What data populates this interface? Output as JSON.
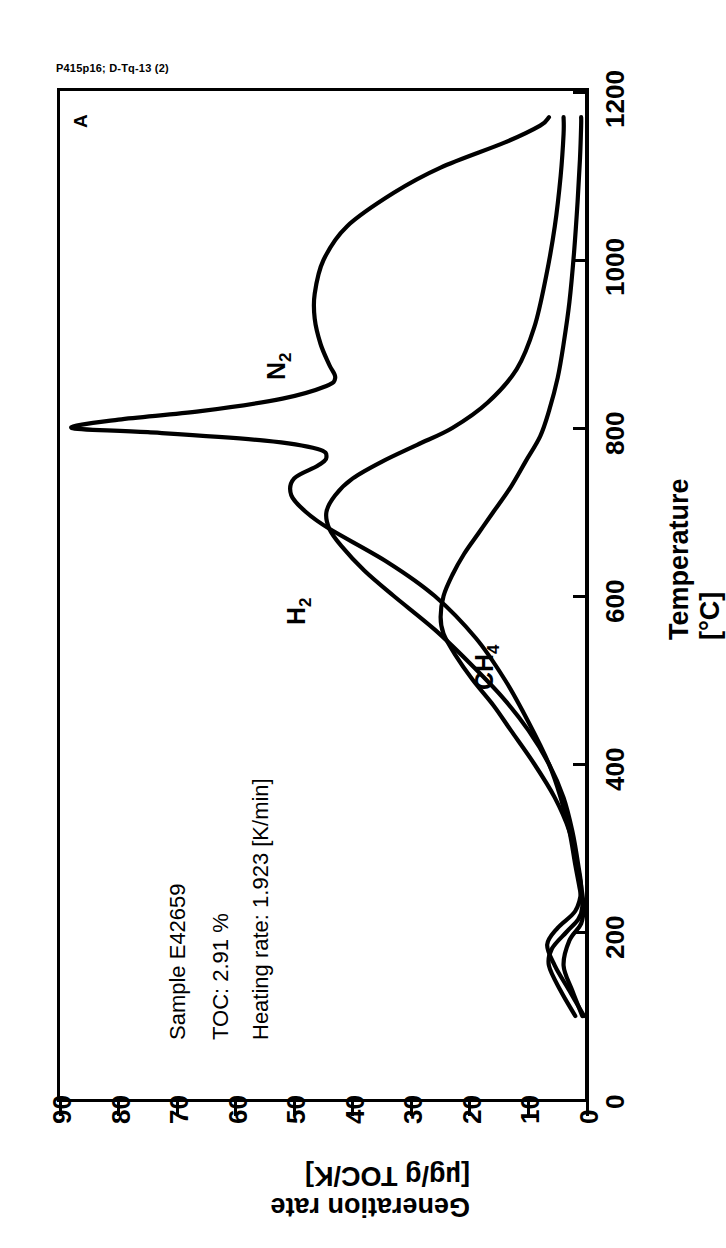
{
  "header": {
    "code": "P415p16; D-Tq-13 (2)",
    "panel_letter": "A"
  },
  "annotations": {
    "sample": "Sample    E42659",
    "toc": "TOC: 2.91 %",
    "heating_rate": "Heating rate: 1.923 [K/min]"
  },
  "axes": {
    "temperature_title": "Temperature [°C]",
    "rate_title": "Generation rate [µg/g TOC/K]",
    "temperature_ticks": [
      "0",
      "200",
      "400",
      "600",
      "800",
      "1000",
      "1200"
    ],
    "rate_ticks": [
      "0",
      "10",
      "20",
      "30",
      "40",
      "50",
      "60",
      "70",
      "80",
      "90"
    ]
  },
  "curve_labels": {
    "n2": "N",
    "n2_sub": "2",
    "h2": "H",
    "h2_sub": "2",
    "ch4": "CH",
    "ch4_sub": "4"
  },
  "colors": {
    "line": "#000000",
    "background": "#ffffff"
  },
  "chart_data": {
    "type": "line",
    "title": "P415p16; D-Tq-13 (2)",
    "orientation": "rotated-90",
    "xlabel": "Temperature [°C]",
    "ylabel": "Generation rate [µg/g TOC/K]",
    "xlim": [
      0,
      1200
    ],
    "ylim": [
      0,
      90
    ],
    "grid": false,
    "legend": "inline-curve-labels",
    "annotations": [
      "Sample    E42659",
      "TOC: 2.91 %",
      "Heating rate: 1.923 [K/min]",
      "A"
    ],
    "series": [
      {
        "name": "N2",
        "label": "N₂",
        "x": [
          100,
          130,
          160,
          180,
          200,
          215,
          230,
          250,
          280,
          320,
          360,
          400,
          450,
          500,
          550,
          600,
          640,
          680,
          700,
          720,
          740,
          755,
          765,
          775,
          785,
          795,
          800,
          810,
          820,
          835,
          850,
          860,
          875,
          900,
          930,
          960,
          1000,
          1040,
          1080,
          1110,
          1140,
          1160,
          1170
        ],
        "y": [
          2.0,
          4.5,
          6.5,
          6.0,
          3.5,
          1.5,
          0.8,
          1.2,
          2.0,
          3.0,
          4.5,
          6.5,
          10.0,
          14.0,
          19.0,
          26.0,
          34.0,
          44.0,
          48.0,
          50.5,
          50.0,
          46.0,
          44.5,
          46.0,
          55.0,
          75.0,
          88.0,
          80.0,
          66.0,
          52.0,
          44.5,
          43.0,
          44.0,
          45.5,
          46.5,
          46.5,
          45.0,
          41.0,
          33.0,
          25.0,
          14.0,
          8.0,
          6.5
        ]
      },
      {
        "name": "H2",
        "label": "H₂",
        "x": [
          100,
          130,
          160,
          185,
          205,
          225,
          250,
          280,
          320,
          360,
          400,
          440,
          480,
          520,
          560,
          600,
          630,
          660,
          680,
          700,
          720,
          740,
          760,
          780,
          800,
          830,
          870,
          920,
          980,
          1040,
          1100,
          1150,
          1170
        ],
        "y": [
          0.5,
          3.0,
          5.5,
          6.8,
          5.0,
          2.0,
          1.0,
          1.5,
          2.5,
          4.0,
          6.5,
          10.0,
          14.5,
          20.0,
          26.0,
          33.0,
          38.0,
          42.0,
          44.0,
          44.5,
          43.0,
          40.0,
          35.0,
          29.0,
          23.0,
          17.0,
          12.0,
          9.0,
          7.0,
          5.5,
          4.5,
          4.0,
          4.0
        ]
      },
      {
        "name": "CH4",
        "label": "CH₄",
        "x": [
          100,
          130,
          160,
          190,
          210,
          230,
          255,
          285,
          320,
          360,
          400,
          440,
          470,
          500,
          530,
          555,
          575,
          600,
          625,
          650,
          675,
          700,
          730,
          760,
          790,
          820,
          860,
          900,
          950,
          1010,
          1070,
          1120,
          1160,
          1170
        ],
        "y": [
          0.8,
          2.5,
          4.0,
          3.0,
          1.0,
          0.6,
          1.0,
          1.8,
          3.0,
          5.5,
          9.0,
          13.0,
          16.0,
          19.5,
          22.5,
          24.5,
          25.0,
          24.5,
          23.0,
          21.0,
          18.5,
          16.0,
          13.0,
          10.5,
          8.0,
          6.5,
          5.0,
          4.0,
          3.0,
          2.2,
          1.6,
          1.2,
          1.0,
          1.0
        ]
      }
    ]
  }
}
